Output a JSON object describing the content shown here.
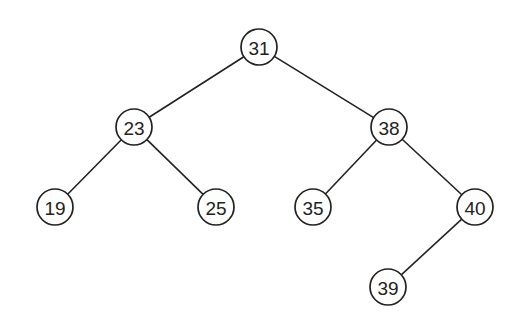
{
  "diagram": {
    "type": "binary-search-tree",
    "node_radius": 18,
    "colors": {
      "stroke": "#222222",
      "fill": "#ffffff",
      "background": "#ffffff"
    },
    "nodes": [
      {
        "id": "n31",
        "label": "31",
        "x": 259,
        "y": 47
      },
      {
        "id": "n23",
        "label": "23",
        "x": 134,
        "y": 127
      },
      {
        "id": "n38",
        "label": "38",
        "x": 389,
        "y": 127
      },
      {
        "id": "n19",
        "label": "19",
        "x": 55,
        "y": 207
      },
      {
        "id": "n25",
        "label": "25",
        "x": 216,
        "y": 207
      },
      {
        "id": "n35",
        "label": "35",
        "x": 313,
        "y": 207
      },
      {
        "id": "n40",
        "label": "40",
        "x": 475,
        "y": 207
      },
      {
        "id": "n39",
        "label": "39",
        "x": 388,
        "y": 287
      }
    ],
    "edges": [
      {
        "from": "n31",
        "to": "n23"
      },
      {
        "from": "n31",
        "to": "n38"
      },
      {
        "from": "n23",
        "to": "n19"
      },
      {
        "from": "n23",
        "to": "n25"
      },
      {
        "from": "n38",
        "to": "n35"
      },
      {
        "from": "n38",
        "to": "n40"
      },
      {
        "from": "n40",
        "to": "n39"
      }
    ]
  }
}
